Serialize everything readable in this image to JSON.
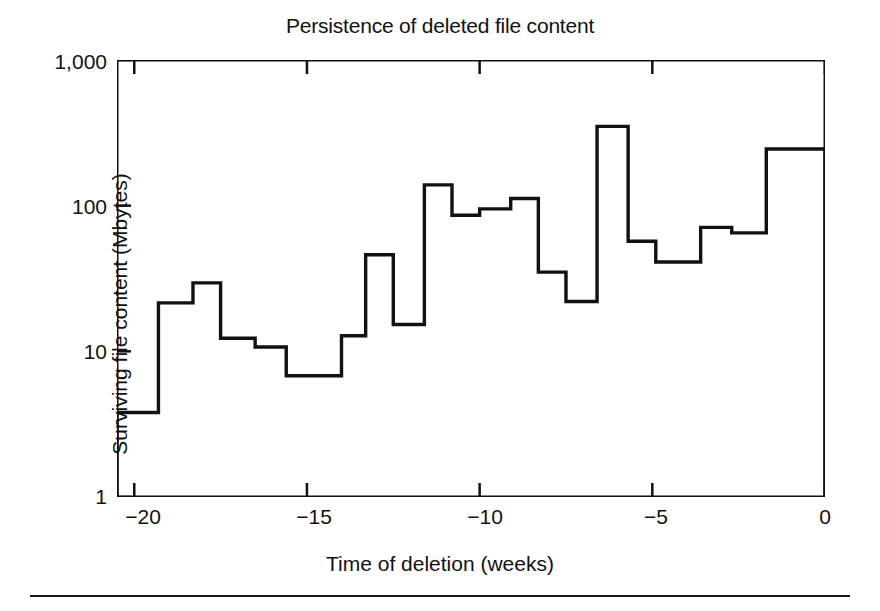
{
  "chart_data": {
    "type": "line",
    "subtype": "step-histogram",
    "title": "Persistence of deleted file content",
    "xlabel": "Time of deletion (weeks)",
    "ylabel": "Surviving file content (Mbytes)",
    "xlim": [
      -20.5,
      0
    ],
    "ylim": [
      1,
      1000
    ],
    "yscale": "log",
    "xscale": "linear",
    "grid": false,
    "legend": null,
    "xticks": [
      -20,
      -15,
      -10,
      -5,
      0
    ],
    "xtick_labels": [
      "−20",
      "−15",
      "−10",
      "−5",
      "0"
    ],
    "yticks": [
      1,
      10,
      100,
      1000
    ],
    "ytick_labels": [
      "1",
      "10",
      "100",
      "1,000"
    ],
    "line_color": "#111111",
    "line_width": 3,
    "bin_edges": [
      -20.5,
      -19.3,
      -18.3,
      -17.5,
      -16.5,
      -15.6,
      -15.0,
      -14.0,
      -13.3,
      -12.5,
      -11.6,
      -10.8,
      -10.0,
      -9.1,
      -8.3,
      -7.5,
      -6.6,
      -5.7,
      -4.9,
      -3.6,
      -2.7,
      -1.7,
      -0.6,
      0.0
    ],
    "values": [
      3.8,
      21.5,
      29.5,
      12.3,
      10.7,
      6.8,
      12.8,
      46.0,
      15.3,
      139.0,
      86.0,
      95.0,
      112.0,
      35.0,
      22.0,
      350.0,
      57.0,
      41.0,
      71.0,
      65.0,
      245.0
    ],
    "series": [
      {
        "name": "Surviving file content",
        "points": [
          {
            "x_start": -20.5,
            "x_end": -19.3,
            "y": 3.8
          },
          {
            "x_start": -19.3,
            "x_end": -18.3,
            "y": 21.5
          },
          {
            "x_start": -18.3,
            "x_end": -17.5,
            "y": 29.5
          },
          {
            "x_start": -17.5,
            "x_end": -16.5,
            "y": 12.3
          },
          {
            "x_start": -16.5,
            "x_end": -15.6,
            "y": 10.7
          },
          {
            "x_start": -15.6,
            "x_end": -14.0,
            "y": 6.8
          },
          {
            "x_start": -14.0,
            "x_end": -13.3,
            "y": 12.8
          },
          {
            "x_start": -13.3,
            "x_end": -12.5,
            "y": 46.0
          },
          {
            "x_start": -12.5,
            "x_end": -11.6,
            "y": 15.3
          },
          {
            "x_start": -11.6,
            "x_end": -10.8,
            "y": 139.0
          },
          {
            "x_start": -10.8,
            "x_end": -10.0,
            "y": 86.0
          },
          {
            "x_start": -10.0,
            "x_end": -9.1,
            "y": 95.0
          },
          {
            "x_start": -9.1,
            "x_end": -8.3,
            "y": 112.0
          },
          {
            "x_start": -8.3,
            "x_end": -7.5,
            "y": 35.0
          },
          {
            "x_start": -7.5,
            "x_end": -6.6,
            "y": 22.0
          },
          {
            "x_start": -6.6,
            "x_end": -5.7,
            "y": 350.0
          },
          {
            "x_start": -5.7,
            "x_end": -4.9,
            "y": 57.0
          },
          {
            "x_start": -4.9,
            "x_end": -3.6,
            "y": 41.0
          },
          {
            "x_start": -3.6,
            "x_end": -2.7,
            "y": 71.0
          },
          {
            "x_start": -2.7,
            "x_end": -1.7,
            "y": 65.0
          },
          {
            "x_start": -1.7,
            "x_end": 0.0,
            "y": 245.0
          }
        ]
      }
    ]
  }
}
